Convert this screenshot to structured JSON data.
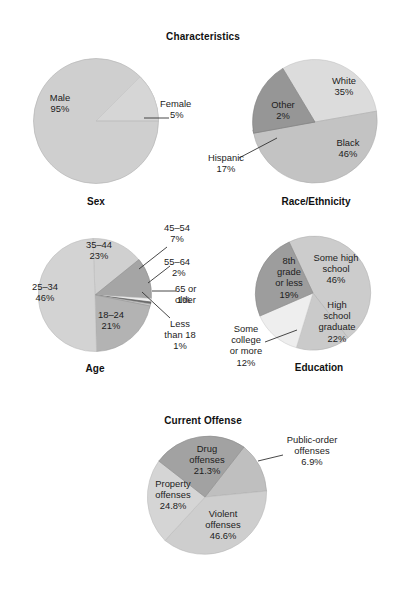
{
  "figure": {
    "section_titles": {
      "characteristics": "Characteristics",
      "current_offense": "Current Offense"
    }
  },
  "chart_data": [
    {
      "type": "pie",
      "id": "sex",
      "title": "Sex",
      "center": [
        96,
        121
      ],
      "radius": 63,
      "start_angle": 0,
      "categories": [
        "Male",
        "Female"
      ],
      "values": [
        95,
        5
      ],
      "value_labels": [
        "95%",
        "5%"
      ],
      "colors": [
        "#cfcfcf",
        "#d4d4d4"
      ],
      "labels": [
        {
          "name": "Male",
          "value": "95%",
          "x": 60,
          "y": 98,
          "leader": false
        },
        {
          "name": "Female",
          "value": "5%",
          "x": 157,
          "y": 100,
          "leader": true
        }
      ]
    },
    {
      "type": "pie",
      "id": "race_ethnicity",
      "title": "Race/Ethnicity",
      "center": [
        315,
        122
      ],
      "radius": 63,
      "categories": [
        "White",
        "Black",
        "Other",
        "Hispanic"
      ],
      "values": [
        35,
        46,
        2,
        17
      ],
      "value_labels": [
        "35%",
        "46%",
        "2%",
        "17%"
      ],
      "colors": [
        "#d9d9d9",
        "#c2c2c2",
        "#bdbdbd",
        "#999999"
      ],
      "labels": [
        {
          "name": "White",
          "value": "35%",
          "x": 336,
          "y": 79,
          "leader": false
        },
        {
          "name": "Black",
          "value": "46%",
          "x": 342,
          "y": 140,
          "leader": false
        },
        {
          "name": "Hispanic",
          "value": "17%",
          "x": 281,
          "y": 103,
          "leader": false
        },
        {
          "name": "Other",
          "value": "2%",
          "x": 222,
          "y": 150,
          "leader": true
        }
      ]
    },
    {
      "type": "pie",
      "id": "age",
      "title": "Age",
      "center": [
        95,
        295
      ],
      "radius": 57,
      "categories": [
        "35–44",
        "45–54",
        "55–64",
        "65 or older",
        "Less than 18",
        "18–24",
        "25–34"
      ],
      "values": [
        23,
        7,
        2,
        1,
        1,
        21,
        46
      ],
      "value_labels": [
        "23%",
        "7%",
        "2%",
        "1%",
        "1%",
        "21%",
        "46%"
      ],
      "colors": [
        "#cfcfcf",
        "#a6a6a6",
        "#ededed",
        "#6e6e6e",
        "#c9c9c9",
        "#b4b4b4",
        "#d2d2d2"
      ],
      "labels": [
        {
          "name": "35–44",
          "value": "23%",
          "x": 98,
          "y": 241,
          "leader": false
        },
        {
          "name": "45–54",
          "value": "7%",
          "x": 175,
          "y": 226,
          "leader": true
        },
        {
          "name": "55–64",
          "value": "2%",
          "x": 185,
          "y": 261,
          "leader": true
        },
        {
          "name": "65 or older",
          "value": "1%",
          "x": 186,
          "y": 288,
          "leader": true
        },
        {
          "name": "Less than 18",
          "value": "1%",
          "x": 177,
          "y": 322,
          "leader": true
        },
        {
          "name": "18–24",
          "value": "21%",
          "x": 110,
          "y": 312,
          "leader": false
        },
        {
          "name": "25–34",
          "value": "46%",
          "x": 48,
          "y": 285,
          "leader": false
        }
      ]
    },
    {
      "type": "pie",
      "id": "education",
      "title": "Education",
      "center": [
        313,
        293
      ],
      "radius": 57,
      "categories": [
        "Some high school",
        "High school graduate",
        "Some college or more",
        "8th grade or less"
      ],
      "values": [
        46,
        22,
        12,
        19
      ],
      "value_labels": [
        "46%",
        "22%",
        "12%",
        "19%"
      ],
      "colors": [
        "#cbcbcb",
        "#c9c9c9",
        "#ededed",
        "#9e9e9e"
      ],
      "labels": [
        {
          "name": "Some high school",
          "value": "46%",
          "x": 333,
          "y": 256,
          "leader": false
        },
        {
          "name": "High school graduate",
          "value": "22%",
          "x": 335,
          "y": 304,
          "leader": false
        },
        {
          "name": "Some college or more",
          "value": "12%",
          "x": 244,
          "y": 323,
          "leader": true
        },
        {
          "name": "8th grade or less",
          "value": "19%",
          "x": 289,
          "y": 260,
          "leader": false
        }
      ]
    },
    {
      "type": "pie",
      "id": "current_offense",
      "title": "Current Offense",
      "center": [
        205,
        497
      ],
      "radius": 63,
      "categories": [
        "Public-order offenses",
        "Violent offenses",
        "Property offenses",
        "Drug offenses"
      ],
      "values": [
        6.9,
        46.6,
        24.8,
        21.3
      ],
      "value_labels": [
        "6.9%",
        "46.6%",
        "24.8%",
        "21.3%"
      ],
      "colors": [
        "#bfbfbf",
        "#cdcdcd",
        "#d4d4d4",
        "#a3a3a3"
      ],
      "labels": [
        {
          "name": "Drug offenses",
          "value": "21.3%",
          "x": 207,
          "y": 448,
          "leader": false
        },
        {
          "name": "Public-order offenses",
          "value": "6.9%",
          "x": 307,
          "y": 440,
          "leader": true
        },
        {
          "name": "Property offenses",
          "value": "24.8%",
          "x": 172,
          "y": 483,
          "leader": false
        },
        {
          "name": "Violent offenses",
          "value": "46.6%",
          "x": 222,
          "y": 513,
          "leader": false
        }
      ]
    }
  ]
}
